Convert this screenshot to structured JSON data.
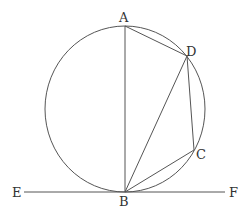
{
  "diagram": {
    "type": "geometry",
    "circle": {
      "cx": 125,
      "cy": 109,
      "rx": 80,
      "ry": 83
    },
    "points": {
      "A": {
        "label": "A",
        "x": 125,
        "y": 26
      },
      "B": {
        "label": "B",
        "x": 125,
        "y": 192
      },
      "C": {
        "label": "C",
        "x": 194,
        "y": 150
      },
      "D": {
        "label": "D",
        "x": 187,
        "y": 56
      },
      "E": {
        "label": "E",
        "x": 24,
        "y": 192
      },
      "F": {
        "label": "F",
        "x": 225,
        "y": 192
      }
    },
    "segments": [
      "AB",
      "AD",
      "DB",
      "DC",
      "CB",
      "EF"
    ],
    "colors": {
      "stroke": "#555555",
      "label": "#333333",
      "background": "#ffffff"
    }
  }
}
